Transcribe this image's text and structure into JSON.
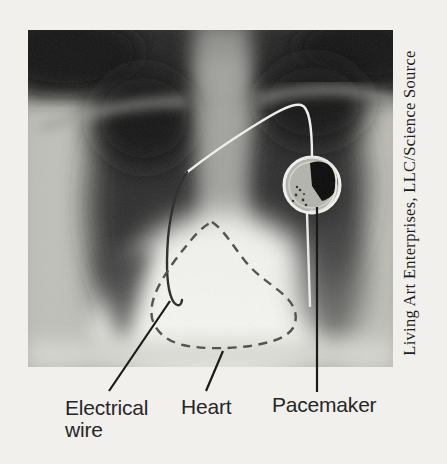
{
  "figure": {
    "type": "chest-xray-with-pacemaker",
    "credit": "Living Art Enterprises, LLC/Science Source",
    "labels": {
      "electrical_wire": "Electrical wire",
      "heart": "Heart",
      "pacemaker": "Pacemaker"
    }
  },
  "colors": {
    "page_background": "#f2f0ed",
    "label_text": "#272727",
    "pointer_line": "#1a1a1a",
    "heart_outline": "#4e4e4e",
    "wire_light": "#f0f0ec",
    "wire_dark": "#2b2b2b",
    "credit_text": "#1c1c1c"
  }
}
